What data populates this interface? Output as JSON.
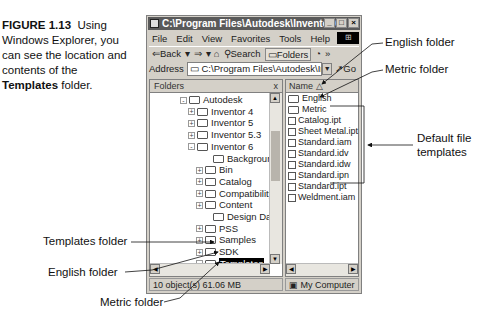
{
  "caption": {
    "figure_number": "FIGURE 1.13",
    "text_before": "Using Windows Explorer, you can see the location and contents of the",
    "bold_word": "Templates",
    "text_after": "folder."
  },
  "window": {
    "title": "C:\\Program Files\\Autodesk\\Inventor 6",
    "buttons": {
      "minimize": "_",
      "maximize": "□",
      "close": "×"
    },
    "menu": [
      "File",
      "Edit",
      "View",
      "Favorites",
      "Tools",
      "Help"
    ],
    "toolbar": {
      "back": "⇐Back",
      "forward": "⇒",
      "search": "Search",
      "folders": "Folders"
    },
    "address": {
      "label": "Address",
      "value": "C:\\Program Files\\Autodesk\\Inventor",
      "go": "Go"
    },
    "folders_pane": {
      "title": "Folders",
      "close": "x",
      "tree": [
        {
          "label": "Autodesk",
          "expander": "-"
        },
        {
          "label": "Inventor 4",
          "expander": "+"
        },
        {
          "label": "Inventor 5",
          "expander": "+"
        },
        {
          "label": "Inventor 5.3",
          "expander": "+"
        },
        {
          "label": "Inventor 6",
          "expander": "-"
        },
        {
          "label": "Backgrounds",
          "expander": ""
        },
        {
          "label": "Bin",
          "expander": "+"
        },
        {
          "label": "Catalog",
          "expander": "+"
        },
        {
          "label": "Compatibility",
          "expander": "+"
        },
        {
          "label": "Content",
          "expander": "+"
        },
        {
          "label": "Design Data",
          "expander": ""
        },
        {
          "label": "PSS",
          "expander": "+"
        },
        {
          "label": "Samples",
          "expander": "+"
        },
        {
          "label": "SDK",
          "expander": "+"
        },
        {
          "label": "Templates",
          "expander": "-",
          "selected": true
        },
        {
          "label": "English",
          "expander": ""
        },
        {
          "label": "Metric",
          "expander": ""
        }
      ]
    },
    "files_pane": {
      "column": "Name",
      "items": [
        {
          "name": "English",
          "type": "folder"
        },
        {
          "name": "Metric",
          "type": "folder"
        },
        {
          "name": "Catalog.ipt",
          "type": "part"
        },
        {
          "name": "Sheet Metal.ipt",
          "type": "part"
        },
        {
          "name": "Standard.iam",
          "type": "assembly"
        },
        {
          "name": "Standard.idv",
          "type": "design-view"
        },
        {
          "name": "Standard.idw",
          "type": "drawing"
        },
        {
          "name": "Standard.ipn",
          "type": "presentation"
        },
        {
          "name": "Standard.ipt",
          "type": "part"
        },
        {
          "name": "Weldment.iam",
          "type": "assembly"
        }
      ]
    },
    "status": {
      "objects": "10 object(s) 61.06 MB",
      "location": "My Computer"
    }
  },
  "callouts": {
    "english_folder_right": "English folder",
    "metric_folder_right": "Metric folder",
    "default_templates_line1": "Default file",
    "default_templates_line2": "templates",
    "templates_folder_left": "Templates folder",
    "english_folder_left": "English folder",
    "metric_folder_bottom": "Metric folder"
  }
}
